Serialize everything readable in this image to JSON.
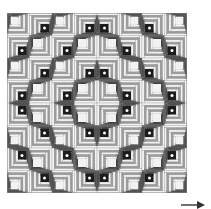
{
  "figure": {
    "grid": {
      "rows": 8,
      "cols": 8
    },
    "colors": {
      "light": [
        "#f2f2f2",
        "#9c9c9c"
      ],
      "dark": [
        "#1c1c1c",
        "#4a4a4a"
      ],
      "line": "#8a8a8a",
      "dot": "#ffffff",
      "arrow": "#333333"
    },
    "blocks": [
      [
        "TL",
        "BR",
        "TL",
        "BR",
        "BL",
        "TR",
        "BL",
        "TR"
      ],
      [
        "BR",
        "TL",
        "BR",
        "TL",
        "TR",
        "BL",
        "TR",
        "BL"
      ],
      [
        "TL",
        "BR",
        "TL",
        "BR",
        "BL",
        "TR",
        "BL",
        "TR"
      ],
      [
        "BR",
        "TL",
        "BR",
        "TL",
        "TR",
        "BL",
        "TR",
        "BL"
      ],
      [
        "TR",
        "BL",
        "TR",
        "BL",
        "BR",
        "TL",
        "BR",
        "TL"
      ],
      [
        "BL",
        "TR",
        "BL",
        "TR",
        "TL",
        "BR",
        "TL",
        "BR"
      ],
      [
        "TR",
        "BL",
        "TR",
        "BL",
        "BR",
        "TL",
        "BR",
        "TL"
      ],
      [
        "BL",
        "TR",
        "BL",
        "TR",
        "TL",
        "BR",
        "TL",
        "BR"
      ]
    ],
    "dots": [
      [
        0,
        1,
        0,
        1,
        1,
        0,
        1,
        0
      ],
      [
        1,
        0,
        1,
        0,
        0,
        1,
        0,
        1
      ],
      [
        0,
        1,
        0,
        1,
        1,
        0,
        1,
        0
      ],
      [
        1,
        0,
        1,
        0,
        0,
        1,
        0,
        1
      ],
      [
        1,
        0,
        1,
        0,
        0,
        1,
        0,
        1
      ],
      [
        0,
        1,
        0,
        1,
        1,
        0,
        1,
        0
      ],
      [
        1,
        0,
        1,
        0,
        0,
        1,
        0,
        1
      ],
      [
        0,
        1,
        0,
        1,
        1,
        0,
        1,
        0
      ]
    ],
    "arrow": {
      "direction": "right"
    }
  }
}
